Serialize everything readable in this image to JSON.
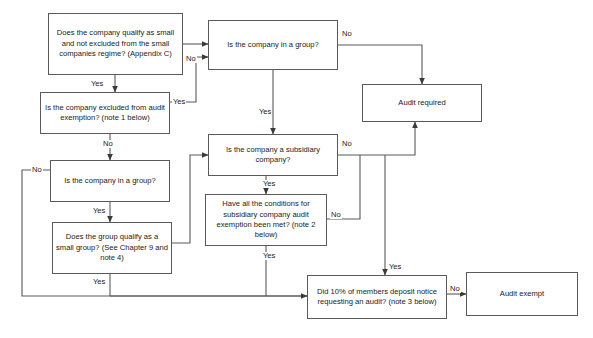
{
  "diagram": {
    "background_color": "#ffffff",
    "line_color": "#5a5a5a",
    "text_color": "#1a1a1a",
    "nodes": [
      {
        "id": "small-company-qualify",
        "text": "Does the company qualify as small and not excluded from the small companies regime? (Appendix C)",
        "x": 48,
        "y": 13,
        "w": 135,
        "h": 62
      },
      {
        "id": "company-in-group-top",
        "text": "Is the company in a group?",
        "x": 208,
        "y": 20,
        "w": 130,
        "h": 50
      },
      {
        "id": "audit-required",
        "text": "Audit required",
        "x": 362,
        "y": 84,
        "w": 120,
        "h": 38
      },
      {
        "id": "excluded-from-exemption",
        "text": "Is the company excluded from audit exemption? (note 1 below)",
        "x": 40,
        "y": 92,
        "w": 130,
        "h": 42
      },
      {
        "id": "subsidiary-company",
        "text": "Is the company a subsidiary company?",
        "x": 208,
        "y": 134,
        "w": 130,
        "h": 42
      },
      {
        "id": "company-in-group-left",
        "text": "Is the company in a group?",
        "x": 50,
        "y": 160,
        "w": 120,
        "h": 42
      },
      {
        "id": "subsidiary-conditions",
        "text": "Have all the conditions for subsidiary company audit exemption been met? (note 2 below)",
        "x": 205,
        "y": 194,
        "w": 122,
        "h": 52
      },
      {
        "id": "group-qualify-small",
        "text": "Does the group qualify as a small group? (See Chapter 9 and note 4)",
        "x": 52,
        "y": 222,
        "w": 120,
        "h": 52
      },
      {
        "id": "members-deposit-notice",
        "text": "Did 10% of members deposit notice requesting an audit? (note 3 below)",
        "x": 307,
        "y": 275,
        "w": 140,
        "h": 44
      },
      {
        "id": "audit-exempt",
        "text": "Audit exempt",
        "x": 466,
        "y": 272,
        "w": 112,
        "h": 44
      }
    ],
    "edge_labels": [
      {
        "id": "q1-no",
        "text": "No",
        "x": 185,
        "y": 55
      },
      {
        "id": "q1-yes",
        "text": "Yes",
        "x": 90,
        "y": 80
      },
      {
        "id": "q2-no",
        "text": "No",
        "x": 341,
        "y": 30
      },
      {
        "id": "q2-yes",
        "text": "Yes",
        "x": 258,
        "y": 108
      },
      {
        "id": "excl-yes",
        "text": "Yes",
        "x": 172,
        "y": 98
      },
      {
        "id": "excl-no",
        "text": "No",
        "x": 102,
        "y": 140
      },
      {
        "id": "subsid-no",
        "text": "No",
        "x": 341,
        "y": 140
      },
      {
        "id": "subsid-yes",
        "text": "Yes",
        "x": 262,
        "y": 180
      },
      {
        "id": "group-l-no",
        "text": "No",
        "x": 31,
        "y": 166
      },
      {
        "id": "group-l-yes",
        "text": "Yes",
        "x": 92,
        "y": 207
      },
      {
        "id": "cond-no",
        "text": "No",
        "x": 330,
        "y": 211
      },
      {
        "id": "cond-yes",
        "text": "Yes",
        "x": 262,
        "y": 252
      },
      {
        "id": "small-grp-yes",
        "text": "Yes",
        "x": 92,
        "y": 278
      },
      {
        "id": "deposit-yes",
        "text": "Yes",
        "x": 388,
        "y": 263
      },
      {
        "id": "deposit-no",
        "text": "No",
        "x": 449,
        "y": 285
      }
    ]
  }
}
